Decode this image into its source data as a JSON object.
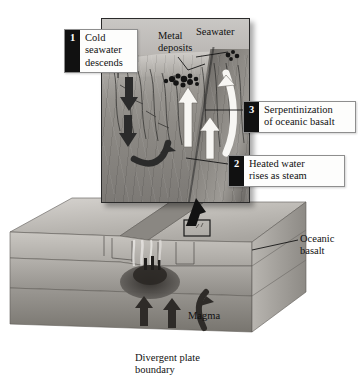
{
  "figure": {
    "caption": "Divergent plate\nboundary",
    "background_color": "#ffffff"
  },
  "inset": {
    "name": "cutaway-close-up",
    "labels": {
      "seawater": "Seawater",
      "metal_deposits": "Metal\ndeposits"
    }
  },
  "callouts": [
    {
      "number": "1",
      "text": "Cold\nseawater\ndescends"
    },
    {
      "number": "2",
      "text": "Heated water\nrises as steam"
    },
    {
      "number": "3",
      "text": "Serpentinization\nof oceanic basalt"
    }
  ],
  "block_diagram": {
    "labels": {
      "oceanic_basalt": "Oceanic\nbasalt",
      "magma": "Magma"
    }
  },
  "colors": {
    "badge_fill": "#111111",
    "badge_text": "#ffffff",
    "callout_bg": "#fdfdfc",
    "callout_border": "#8e8e8e",
    "text": "#111111",
    "rock_light": "#cfccc8",
    "rock_mid": "#8e8b86",
    "rock_dark": "#6c6965",
    "magma_dark": "#3a3733",
    "deposit": "#161616",
    "cold_arrow": "#3a3a3a",
    "hot_arrow": "#f5f4f1"
  }
}
